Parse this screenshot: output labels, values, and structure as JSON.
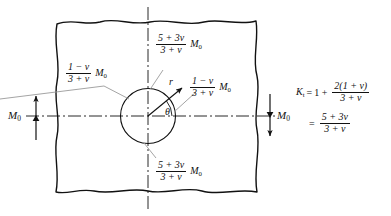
{
  "figure": {
    "type": "mechanics-diagram",
    "plate": {
      "name": "infinite-plate-with-hole"
    },
    "hole": {
      "name": "circular-hole"
    }
  },
  "symbols": {
    "nu": "ν",
    "theta": "θ",
    "r": "r",
    "M": "M",
    "M_sub": "0",
    "K": "K",
    "K_sub": "t"
  },
  "labels": {
    "top_moment": {
      "numerator": "5 + 3ν",
      "denominator": "3 + ν",
      "factor": "M",
      "factor_sub": "0",
      "position": "top-of-hole"
    },
    "bottom_moment": {
      "numerator": "5 + 3ν",
      "denominator": "3 + ν",
      "factor": "M",
      "factor_sub": "0",
      "position": "bottom-of-hole"
    },
    "left_moment": {
      "numerator": "1 − ν",
      "denominator": "3 + ν",
      "factor": "M",
      "factor_sub": "0",
      "position": "left-of-hole"
    },
    "right_moment": {
      "numerator": "1 − ν",
      "denominator": "3 + ν",
      "factor": "M",
      "factor_sub": "0",
      "position": "right-of-hole"
    },
    "applied_left": {
      "text": "M",
      "sub": "0"
    },
    "applied_right": {
      "text": "M",
      "sub": "0"
    },
    "radius": "r",
    "angle": "θ"
  },
  "equation": {
    "line1": {
      "lhs": "K",
      "lhs_sub": "t",
      "eq": "=",
      "one": "1 +",
      "numerator": "2(1 + ν)",
      "denominator": "3 + ν"
    },
    "line2": {
      "eq": "=",
      "numerator": "5 + 3ν",
      "denominator": "3 + ν"
    }
  },
  "colors": {
    "ink": "#111111",
    "leader": "#9a9a9a",
    "background": "#ffffff"
  }
}
